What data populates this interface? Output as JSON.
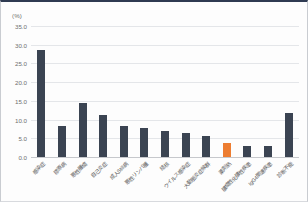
{
  "chart": {
    "unit_label": "(%)",
    "accent_color": "#ED7D31",
    "bar_color": "#3B4452",
    "grid_color": "#E4E6E9"
  },
  "chart_data": {
    "type": "bar",
    "title": "",
    "xlabel": "",
    "ylabel": "(%)",
    "ylim": [
      0,
      35
    ],
    "ytick_values": [
      0,
      5,
      10,
      15,
      20,
      25,
      30,
      35
    ],
    "ytick_labels": [
      "0.0",
      "5.0",
      "10.0",
      "15.0",
      "20.0",
      "25.0",
      "30.0",
      "35.0"
    ],
    "grid": true,
    "legend": "none",
    "categories": [
      "感染症",
      "膠原病",
      "悪性腫瘍",
      "自己炎症",
      "成人Still病",
      "悪性リンパ腫",
      "結核",
      "ウイルス感染症",
      "大動脈炎症候群",
      "薬剤熱",
      "膿瘍性化膿性疾患",
      "IgG4関連疾患",
      "診断不能"
    ],
    "values": [
      28.7,
      8.4,
      14.4,
      11.2,
      8.3,
      7.7,
      7.0,
      6.4,
      5.7,
      3.7,
      3.0,
      3.0,
      11.7
    ],
    "highlight_index": 9,
    "highlight_color": "#ED7D31"
  }
}
